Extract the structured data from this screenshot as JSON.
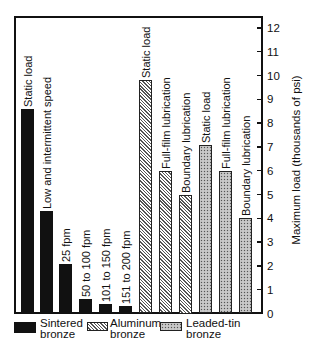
{
  "chart_data": {
    "type": "bar",
    "title": "",
    "xlabel": "",
    "ylabel": "Maximum load (thousands of psi)",
    "ylim": [
      0,
      12
    ],
    "yticks": [
      0,
      1,
      2,
      3,
      4,
      5,
      6,
      7,
      8,
      9,
      10,
      11,
      12
    ],
    "y_axis_position": "right",
    "grid": false,
    "legend_position": "bottom",
    "series": [
      {
        "name": "Sintered bronze",
        "fill": "solid-black",
        "categories": [
          "Static load",
          "Low and intermittent speed",
          "25 fpm",
          "50 to 100 fpm",
          "101 to 150 fpm",
          "151 to 200 fpm"
        ],
        "values": [
          8.6,
          4.3,
          2.1,
          0.6,
          0.4,
          0.3
        ]
      },
      {
        "name": "Aluminum bronze",
        "fill": "diagonal-hatch",
        "categories": [
          "Static load",
          "Full-film lubrication",
          "Boundary lubrication"
        ],
        "values": [
          9.8,
          6.0,
          5.0
        ]
      },
      {
        "name": "Leaded-tin bronze",
        "fill": "stipple",
        "categories": [
          "Static load",
          "Full-film lubrication",
          "Boundary lubrication"
        ],
        "values": [
          7.1,
          6.0,
          4.0
        ]
      }
    ]
  },
  "axis": {
    "ylabel": "Maximum load (thousands of psi)",
    "ticks": [
      "0",
      "1",
      "2",
      "3",
      "4",
      "5",
      "6",
      "7",
      "8",
      "9",
      "10",
      "11",
      "12"
    ]
  },
  "bars": [
    {
      "label": "Static load",
      "value": 8.6,
      "style": "solid"
    },
    {
      "label": "Low and intermittent speed",
      "value": 4.3,
      "style": "solid"
    },
    {
      "label": "25 fpm",
      "value": 2.1,
      "style": "solid"
    },
    {
      "label": "50 to 100 fpm",
      "value": 0.6,
      "style": "solid"
    },
    {
      "label": "101 to 150 fpm",
      "value": 0.4,
      "style": "solid"
    },
    {
      "label": "151 to 200 fpm",
      "value": 0.3,
      "style": "solid"
    },
    {
      "label": "Static load",
      "value": 9.8,
      "style": "hatch"
    },
    {
      "label": "Full-film lubrication",
      "value": 6.0,
      "style": "hatch"
    },
    {
      "label": "Boundary lubrication",
      "value": 5.0,
      "style": "hatch"
    },
    {
      "label": "Static load",
      "value": 7.1,
      "style": "dots"
    },
    {
      "label": "Full-film lubrication",
      "value": 6.0,
      "style": "dots"
    },
    {
      "label": "Boundary lubrication",
      "value": 4.0,
      "style": "dots"
    }
  ],
  "legend": [
    {
      "line1": "Sintered",
      "line2": "bronze",
      "style": "solid"
    },
    {
      "line1": "Aluminum",
      "line2": "bronze",
      "style": "hatch"
    },
    {
      "line1": "Leaded-tin",
      "line2": "bronze",
      "style": "dots"
    }
  ]
}
